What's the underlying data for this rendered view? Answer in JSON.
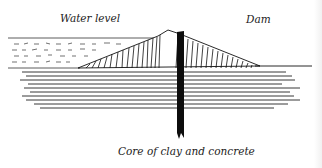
{
  "diagram": {
    "type": "cross-section",
    "labels": {
      "water_level": "Water level",
      "dam": "Dam",
      "core": "Core of clay and concrete"
    },
    "colors": {
      "ink": "#111111",
      "background": "#ffffff"
    }
  }
}
